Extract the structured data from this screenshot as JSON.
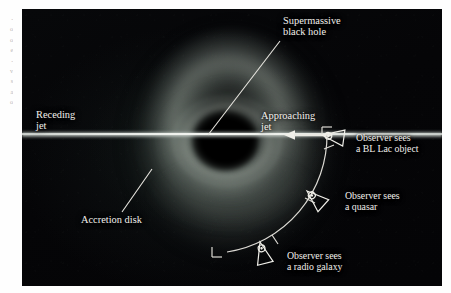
{
  "figure": {
    "type": "astronomy-diagram",
    "margin_text": "-\no\no\ne\n-\nv\ns\na\no"
  },
  "labels": {
    "supermassive_black_hole": "Supermassive\nblack hole",
    "receding_jet": "Receding\njet",
    "approaching_jet": "Approaching\njet",
    "accretion_disk": "Accretion disk",
    "observer_bl_lac": "Observer sees\na BL Lac object",
    "observer_quasar": "Observer sees\na quasar",
    "observer_radio_galaxy": "Observer sees\na radio galaxy"
  },
  "observers": [
    {
      "name": "bl-lac-observer",
      "sees": "a BL Lac object",
      "angle_deg": 8
    },
    {
      "name": "quasar-observer",
      "sees": "a quasar",
      "angle_deg": 42
    },
    {
      "name": "radio-galaxy-observer",
      "sees": "a radio galaxy",
      "angle_deg": 76
    }
  ],
  "colors": {
    "plate_background": "#050506",
    "label_text": "#f2f0ec",
    "leader_line": "#e8e6e0",
    "jet_core": "#f5f6f2",
    "arc": "#dcdad4",
    "page_background": "#ffffff"
  }
}
